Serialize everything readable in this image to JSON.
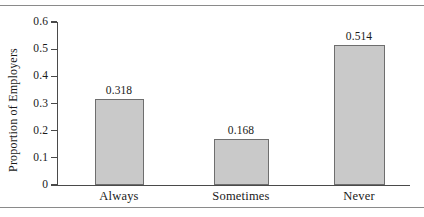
{
  "figure": {
    "frame": {
      "top_rule": true,
      "bottom_rule": true
    }
  },
  "chart_data": {
    "type": "bar",
    "title": "",
    "xlabel": "",
    "ylabel": "Proportion of Employers",
    "categories": [
      "Always",
      "Sometimes",
      "Never"
    ],
    "values": [
      0.318,
      0.168,
      0.514
    ],
    "value_labels": [
      "0.318",
      "0.168",
      "0.514"
    ],
    "ylim": [
      0,
      0.6
    ],
    "ytick_values": [
      0,
      0.1,
      0.2,
      0.3,
      0.4,
      0.5,
      0.6
    ],
    "ytick_labels": [
      "0",
      "0.1",
      "0.2",
      "0.3",
      "0.4",
      "0.5",
      "0.6"
    ],
    "grid": false,
    "legend": null,
    "bar_fill_color": "#c9c9c9",
    "bar_edge_color": "#6e6e6e",
    "axis_color": "#4a4a4a"
  }
}
